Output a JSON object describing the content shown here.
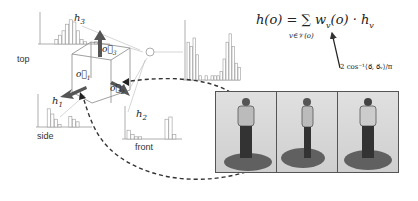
{
  "labels": {
    "top": "top",
    "side": "side",
    "front": "front",
    "h1": "h",
    "h1_sub": "1",
    "h2": "h",
    "h2_sub": "2",
    "h3": "h",
    "h3_sub": "3",
    "o1": "o⃗",
    "o1_sub": "1",
    "o2": "o⃗",
    "o2_sub": "2",
    "o3": "o⃗",
    "o3_sub": "3"
  },
  "formula": {
    "main": "h(o) = ∑ w",
    "main_sub": "v",
    "main_rest": "(o) · h",
    "main_rest_sub": "v",
    "sum_under": "v∈𝒱(o)",
    "weight": "2 cos⁻¹⟨o⃗, o⃗ᵥ⟩/π"
  },
  "histograms": {
    "top": [
      0,
      0,
      0,
      2,
      4,
      6,
      9,
      11,
      10,
      6,
      2,
      1,
      0,
      0,
      1,
      1,
      0
    ],
    "side": [
      0,
      0,
      7,
      5,
      3,
      1,
      0,
      0,
      4,
      3,
      2,
      0
    ],
    "front": [
      4,
      2,
      1,
      1,
      0,
      0,
      0,
      0,
      0,
      0,
      9,
      10,
      2,
      0
    ],
    "combined": [
      9,
      8,
      10,
      6,
      1,
      0,
      1,
      0,
      1,
      1,
      1,
      2,
      5,
      9,
      11,
      8,
      4,
      3
    ]
  },
  "photos": [
    "front-view",
    "side-view",
    "back-view"
  ],
  "colors": {
    "arrow": "#555555",
    "line": "#888888",
    "bar": "#999999",
    "dashed": "#333333"
  }
}
